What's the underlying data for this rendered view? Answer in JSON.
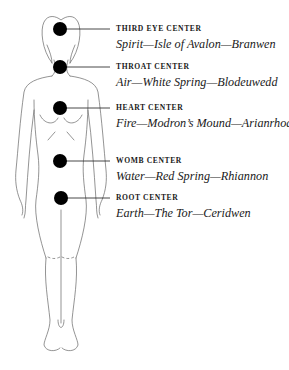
{
  "diagram": {
    "type": "body-energy-centers",
    "centers": [
      {
        "name": "THIRD EYE CENTER",
        "detail": "Spirit—Isle of Avalon—Branwen",
        "y": 29
      },
      {
        "name": "THROAT CENTER",
        "detail": "Air—White Spring—Blodeuwedd",
        "y": 67
      },
      {
        "name": "HEART CENTER",
        "detail": "Fire—Modron’s Mound—Arianrhod",
        "y": 108
      },
      {
        "name": "WOMB CENTER",
        "detail": "Water—Red Spring—Rhiannon",
        "y": 161
      },
      {
        "name": "ROOT CENTER",
        "detail": "Earth—The Tor—Ceridwen",
        "y": 198
      }
    ],
    "colors": {
      "dot": "#000000",
      "outline": "#555555",
      "text": "#1a1a1a"
    }
  }
}
